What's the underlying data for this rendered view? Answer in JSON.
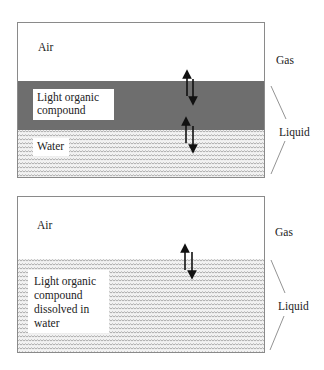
{
  "diagram1": {
    "air_label": "Air",
    "organic_label_line1": "Light organic",
    "organic_label_line2": "compound",
    "water_label": "Water",
    "gas_label": "Gas",
    "liquid_label": "Liquid"
  },
  "diagram2": {
    "air_label": "Air",
    "dissolved_line1": "Light organic",
    "dissolved_line2": "compound",
    "dissolved_line3": "dissolved in",
    "dissolved_line4": "water",
    "gas_label": "Gas",
    "liquid_label": "Liquid"
  },
  "colors": {
    "organic_layer": "#6e6e6e",
    "pattern_fill": "#f2f2f2",
    "pattern_stroke": "#9a9a9a",
    "border": "#8a8a8a",
    "arrow": "#111111"
  }
}
